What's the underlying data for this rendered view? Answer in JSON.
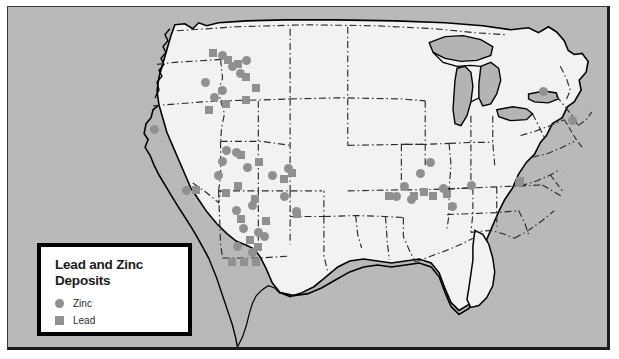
{
  "map": {
    "title": "Lead and Zinc Deposits",
    "background_color": "#b9b9b9",
    "land_color": "#f2f2f0",
    "water_color": "#b4b4b4",
    "border_color": "#000000",
    "state_border_color": "#2a2a2a",
    "frame_color": "#3a3a3a"
  },
  "legend": {
    "title": "Lead and Zinc\nDeposits",
    "marker_color": "#909090",
    "items": [
      {
        "label": "Zinc",
        "shape": "circle",
        "color": "#909090"
      },
      {
        "label": "Lead",
        "shape": "square",
        "color": "#909090"
      }
    ]
  },
  "chart_data": {
    "type": "scatter",
    "title": "Lead and Zinc Deposits",
    "xlabel": "",
    "ylabel": "",
    "legend_position": "bottom-left",
    "grid": false,
    "series": [
      {
        "name": "Zinc",
        "shape": "circle",
        "color": "#909090",
        "points": [
          [
            222,
            55
          ],
          [
            232,
            66
          ],
          [
            240,
            73
          ],
          [
            246,
            60
          ],
          [
            214,
            97
          ],
          [
            222,
            90
          ],
          [
            205,
            82
          ],
          [
            154,
            129
          ],
          [
            222,
            161
          ],
          [
            218,
            175
          ],
          [
            226,
            150
          ],
          [
            236,
            152
          ],
          [
            186,
            190
          ],
          [
            247,
            167
          ],
          [
            288,
            168
          ],
          [
            272,
            175
          ],
          [
            284,
            196
          ],
          [
            252,
            205
          ],
          [
            236,
            210
          ],
          [
            243,
            228
          ],
          [
            258,
            232
          ],
          [
            237,
            246
          ],
          [
            252,
            252
          ],
          [
            264,
            236
          ],
          [
            296,
            211
          ],
          [
            420,
            173
          ],
          [
            404,
            186
          ],
          [
            396,
            196
          ],
          [
            411,
            199
          ],
          [
            443,
            188
          ],
          [
            452,
            206
          ],
          [
            471,
            185
          ],
          [
            519,
            182
          ],
          [
            543,
            91
          ],
          [
            572,
            120
          ],
          [
            430,
            162
          ]
        ]
      },
      {
        "name": "Lead",
        "shape": "square",
        "color": "#909090",
        "points": [
          [
            213,
            53
          ],
          [
            228,
            60
          ],
          [
            238,
            64
          ],
          [
            246,
            77
          ],
          [
            226,
            104
          ],
          [
            246,
            100
          ],
          [
            256,
            88
          ],
          [
            209,
            110
          ],
          [
            241,
            155
          ],
          [
            259,
            162
          ],
          [
            292,
            173
          ],
          [
            284,
            179
          ],
          [
            226,
            193
          ],
          [
            255,
            199
          ],
          [
            266,
            221
          ],
          [
            241,
            219
          ],
          [
            250,
            240
          ],
          [
            258,
            247
          ],
          [
            232,
            262
          ],
          [
            244,
            262
          ],
          [
            256,
            262
          ],
          [
            297,
            214
          ],
          [
            389,
            196
          ],
          [
            414,
            196
          ],
          [
            424,
            192
          ],
          [
            433,
            196
          ],
          [
            447,
            194
          ],
          [
            520,
            181
          ],
          [
            196,
            190
          ],
          [
            238,
            186
          ]
        ]
      }
    ]
  }
}
